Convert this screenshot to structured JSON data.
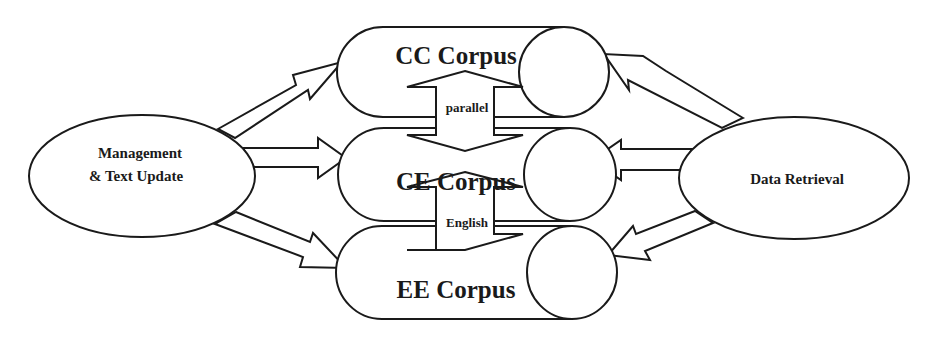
{
  "diagram": {
    "left_node": {
      "line1": "Management",
      "line2": "& Text Update"
    },
    "right_node": {
      "label": "Data Retrieval"
    },
    "corpora": [
      {
        "label": "CC Corpus"
      },
      {
        "label": "CE Corpus"
      },
      {
        "label": "EE Corpus"
      }
    ],
    "links": [
      {
        "label": "parallel",
        "between": [
          "CC Corpus",
          "CE Corpus"
        ]
      },
      {
        "label": "English",
        "between": [
          "CE Corpus",
          "EE Corpus"
        ]
      }
    ],
    "colors": {
      "stroke": "#1a1a1a",
      "fill": "#ffffff",
      "background": "#ffffff"
    }
  }
}
